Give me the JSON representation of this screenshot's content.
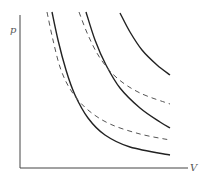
{
  "diagram": {
    "type": "p-V diagram",
    "axes": {
      "y_label": "p",
      "x_label": "V"
    },
    "curves": [
      {
        "id": "solid-1",
        "style": "solid",
        "color": "#222222",
        "points": [
          [
            52,
            12
          ],
          [
            58,
            40
          ],
          [
            66,
            70
          ],
          [
            75,
            95
          ],
          [
            88,
            118
          ],
          [
            105,
            135
          ],
          [
            130,
            147
          ],
          [
            170,
            155
          ]
        ]
      },
      {
        "id": "dashed-1",
        "style": "dashed",
        "color": "#555555",
        "points": [
          [
            47,
            12
          ],
          [
            53,
            40
          ],
          [
            61,
            70
          ],
          [
            72,
            92
          ],
          [
            88,
            110
          ],
          [
            110,
            124
          ],
          [
            140,
            134
          ],
          [
            170,
            140
          ]
        ]
      },
      {
        "id": "solid-2",
        "style": "solid",
        "color": "#222222",
        "points": [
          [
            86,
            12
          ],
          [
            95,
            40
          ],
          [
            106,
            65
          ],
          [
            120,
            88
          ],
          [
            140,
            108
          ],
          [
            160,
            122
          ],
          [
            170,
            128
          ]
        ]
      },
      {
        "id": "dashed-2",
        "style": "dashed",
        "color": "#555555",
        "points": [
          [
            79,
            12
          ],
          [
            88,
            35
          ],
          [
            100,
            58
          ],
          [
            117,
            78
          ],
          [
            140,
            93
          ],
          [
            170,
            104
          ]
        ]
      },
      {
        "id": "solid-3",
        "style": "solid",
        "color": "#222222",
        "points": [
          [
            120,
            13
          ],
          [
            130,
            32
          ],
          [
            142,
            50
          ],
          [
            157,
            65
          ],
          [
            170,
            75
          ]
        ]
      }
    ],
    "colors": {
      "axis": "#444444",
      "solid": "#222222",
      "dashed": "#555555",
      "background": "#ffffff"
    }
  }
}
